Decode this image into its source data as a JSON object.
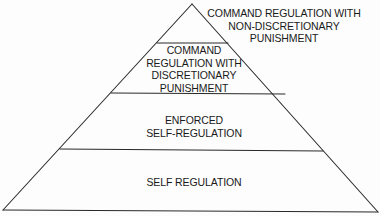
{
  "diagram": {
    "type": "pyramid",
    "line_color": "#2a2a2a",
    "background": "#fdfdfd",
    "tiers_top_to_bottom": [
      {
        "id": "apex",
        "label_lines": [
          "COMMAND REGULATION WITH",
          "NON-DISCRETIONARY",
          "PUNISHMENT"
        ],
        "label_position": "outside-right"
      },
      {
        "id": "tier2",
        "label_lines": [
          "COMMAND",
          "REGULATION WITH",
          "DISCRETIONARY",
          "PUNISHMENT"
        ],
        "label_position": "inside"
      },
      {
        "id": "tier3",
        "label_lines": [
          "ENFORCED",
          "SELF-REGULATION"
        ],
        "label_position": "inside"
      },
      {
        "id": "tier4",
        "label_lines": [
          "SELF REGULATION"
        ],
        "label_position": "inside"
      }
    ]
  }
}
